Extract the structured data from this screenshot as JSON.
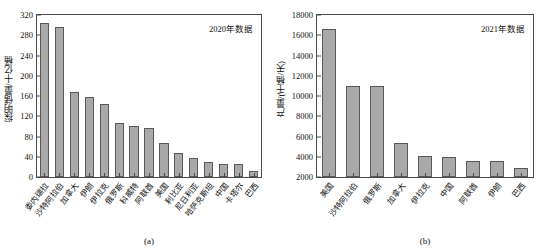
{
  "figure": {
    "panels": [
      {
        "id": "panel-a",
        "subcaption": "(a)",
        "annotation": "2020年数据",
        "ylabel": "探明储量/十亿桶"
      },
      {
        "id": "panel-b",
        "subcaption": "(b)",
        "annotation": "2021年数据",
        "ylabel": "产量/(千桶/天)"
      }
    ]
  },
  "chart_data": [
    {
      "type": "bar",
      "title": "",
      "subcaption": "(a)",
      "annotation": "2020年数据",
      "xlabel": "",
      "ylabel": "探明储量/十亿桶",
      "ylim": [
        0,
        320
      ],
      "yticks": [
        0,
        40,
        80,
        120,
        160,
        200,
        240,
        280,
        320
      ],
      "ytick_labels": [
        "0",
        "40",
        "80",
        "120",
        "160",
        "200",
        "240",
        "280",
        "320"
      ],
      "grid": false,
      "legend": "none",
      "bar_color": "#a9a9a9",
      "bar_edge_color": "#595959",
      "categories": [
        "委内瑞拉",
        "沙特阿拉伯",
        "加拿大",
        "伊朗",
        "伊拉克",
        "俄罗斯",
        "科威特",
        "阿联酋",
        "美国",
        "利比亚",
        "尼日利亚",
        "哈萨克斯坦",
        "中国",
        "卡塔尔",
        "巴西"
      ],
      "values": [
        304,
        297,
        167,
        158,
        145,
        106,
        100,
        97,
        68,
        48,
        37,
        30,
        26,
        25,
        12
      ]
    },
    {
      "type": "bar",
      "title": "",
      "subcaption": "(b)",
      "annotation": "2021年数据",
      "xlabel": "",
      "ylabel": "产量/(千桶/天)",
      "ylim": [
        2000,
        18000
      ],
      "yticks": [
        2000,
        4000,
        6000,
        8000,
        10000,
        12000,
        14000,
        16000,
        18000
      ],
      "ytick_labels": [
        "2000",
        "4000",
        "6000",
        "8000",
        "10000",
        "12000",
        "14000",
        "16000",
        "18000"
      ],
      "grid": false,
      "legend": "none",
      "bar_color": "#a9a9a9",
      "bar_edge_color": "#595959",
      "categories": [
        "美国",
        "沙特阿拉伯",
        "俄罗斯",
        "加拿大",
        "伊拉克",
        "中国",
        "阿联酋",
        "伊朗",
        "巴西"
      ],
      "values": [
        16600,
        10950,
        10950,
        5400,
        4100,
        4000,
        3620,
        3600,
        2920
      ]
    }
  ]
}
